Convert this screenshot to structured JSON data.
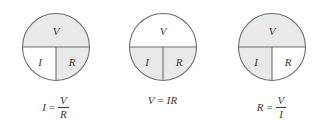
{
  "diagram": {
    "colors": {
      "shaded": "#e9e9e9",
      "unshaded": "#ffffff",
      "stroke": "#6e6e6e",
      "text": "#3a3a3a",
      "background": "#ffffff"
    },
    "wheels": [
      {
        "id": "wheel-solve-for-i",
        "top_label": "V",
        "bottom_left_label": "I",
        "bottom_right_label": "R",
        "top_shaded": true,
        "bottom_left_shaded": false,
        "bottom_right_shaded": true,
        "formula": {
          "type": "fraction",
          "lhs": "I",
          "equals": "=",
          "numerator": "V",
          "denominator": "R",
          "plain": "I = V/R"
        }
      },
      {
        "id": "wheel-solve-for-v",
        "top_label": "V",
        "bottom_left_label": "I",
        "bottom_right_label": "R",
        "top_shaded": false,
        "bottom_left_shaded": true,
        "bottom_right_shaded": true,
        "formula": {
          "type": "product",
          "lhs": "V",
          "equals": "=",
          "product": "IR",
          "plain": "V = IR"
        }
      },
      {
        "id": "wheel-solve-for-r",
        "top_label": "V",
        "bottom_left_label": "I",
        "bottom_right_label": "R",
        "top_shaded": true,
        "bottom_left_shaded": true,
        "bottom_right_shaded": false,
        "formula": {
          "type": "fraction",
          "lhs": "R",
          "equals": "=",
          "numerator": "V",
          "denominator": "I",
          "plain": "R = V/I"
        }
      }
    ]
  }
}
